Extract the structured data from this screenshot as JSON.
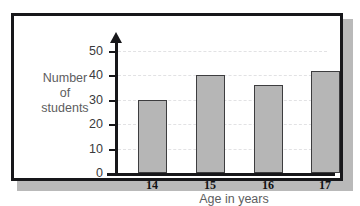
{
  "chart_data": {
    "type": "bar",
    "title": "",
    "xlabel": "Age in years",
    "ylabel": "Number of students",
    "ylabel_lines": [
      "Number",
      "of",
      "students"
    ],
    "categories": [
      "14",
      "15",
      "16",
      "17"
    ],
    "values": [
      30,
      40,
      36,
      42
    ],
    "ylim": [
      0,
      50
    ],
    "yticks": [
      0,
      10,
      20,
      30,
      40,
      50
    ],
    "ytick_labels": [
      "0",
      "10",
      "20",
      "30",
      "40",
      "50"
    ],
    "grid": true,
    "grid_axis": "y",
    "grid_style": "dashed",
    "legend": false,
    "colors": {
      "bar_fill": "#b6b6b6",
      "bar_edge": "#3d3d3f",
      "axis": "#17171a",
      "grid": "#e2e2e4",
      "frame": "#17171a",
      "background": "#ffffff",
      "tick_label": "#3a3a3c",
      "axis_title": "#5d5d60",
      "category_label": "#111113",
      "shadow": "#b9b9b9"
    }
  }
}
